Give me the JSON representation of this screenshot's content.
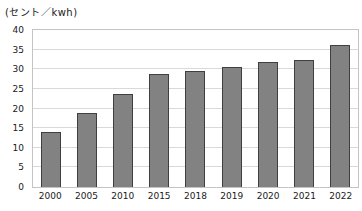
{
  "chart_data": {
    "type": "bar",
    "title": "(セント／kwh)",
    "categories": [
      "2000",
      "2005",
      "2010",
      "2015",
      "2018",
      "2019",
      "2020",
      "2021",
      "2022"
    ],
    "values": [
      14,
      18.8,
      23.8,
      28.8,
      29.5,
      30.5,
      31.9,
      32.3,
      36.2
    ],
    "xlabel": "",
    "ylabel": "",
    "ylim": [
      0,
      40
    ],
    "yticks": [
      0,
      5,
      10,
      15,
      20,
      25,
      30,
      35,
      40
    ],
    "grid": true,
    "legend_position": "none",
    "bar_color": "#828282",
    "bar_border_color": "#3f3f3f",
    "gridline_color": "#d9d9d9",
    "plot_border_color": "#c4c4c4",
    "axis_text_color": "#1a1a1a",
    "background_color": "#ffffff"
  }
}
